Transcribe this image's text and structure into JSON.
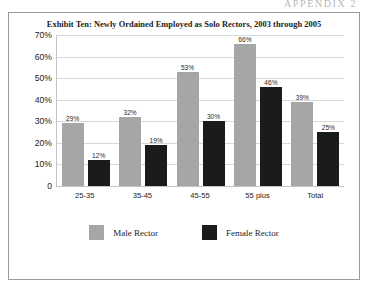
{
  "page": {
    "header_text": "APPENDIX 2"
  },
  "chart_data": {
    "type": "bar",
    "title": "Exhibit Ten: Newly Ordained Employed as Solo Rectors, 2003 through 2005",
    "xlabel": "",
    "ylabel": "",
    "ylim": [
      0,
      70
    ],
    "grid": true,
    "legend_position": "bottom",
    "categories": [
      "25-35",
      "35-45",
      "45-55",
      "55 plus",
      "Total"
    ],
    "ytick_labels": [
      "70%",
      "60%",
      "50%",
      "40%",
      "30%",
      "20%",
      "10%",
      "0"
    ],
    "ytick_values": [
      70,
      60,
      50,
      40,
      30,
      20,
      10,
      0
    ],
    "series": [
      {
        "name": "Male Rector",
        "color": "#a6a6a6",
        "values": [
          29,
          32,
          53,
          66,
          39
        ],
        "labels": [
          "29%",
          "32%",
          "53%",
          "66%",
          "39%"
        ]
      },
      {
        "name": "Female Rector",
        "color": "#1b1b1b",
        "values": [
          12,
          19,
          30,
          46,
          25
        ],
        "labels": [
          "12%",
          "19%",
          "30%",
          "46%",
          "25%"
        ]
      }
    ]
  }
}
